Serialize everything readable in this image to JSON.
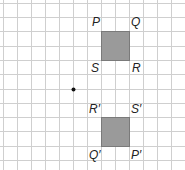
{
  "diagram": {
    "type": "grid-transformation",
    "grid": {
      "color": "#c8c8c8",
      "spacing_px": 14.3
    },
    "colors": {
      "square_fill": "#999999",
      "square_stroke": "#777777",
      "dot": "#111111"
    },
    "original_square": {
      "labels": {
        "top_left": "P",
        "top_right": "Q",
        "bottom_left": "S",
        "bottom_right": "R"
      }
    },
    "image_square": {
      "labels": {
        "top_left": "R′",
        "top_right": "S′",
        "bottom_left": "Q′",
        "bottom_right": "P′"
      }
    },
    "center_point": {
      "label": ""
    }
  }
}
